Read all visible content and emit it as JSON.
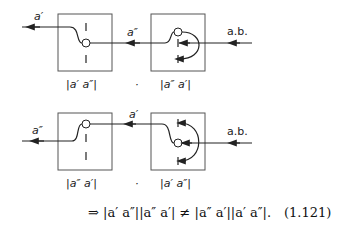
{
  "diagram": {
    "row1": {
      "output_label": "a′",
      "between_label": "a″",
      "input_label": "a.b.",
      "left_box_caption": "|a′ a″|",
      "dot": "·",
      "right_box_caption": "|a″ a′|"
    },
    "row2": {
      "output_label": "a″",
      "between_label": "a′",
      "input_label": "a.b.",
      "left_box_caption": "|a″ a′|",
      "dot": "·",
      "right_box_caption": "|a′ a″|"
    },
    "equation": {
      "text": "⇒ |a′ a″||a″ a′| ≠ |a″ a′||a′ a″|.",
      "number": "(1.121)"
    }
  }
}
